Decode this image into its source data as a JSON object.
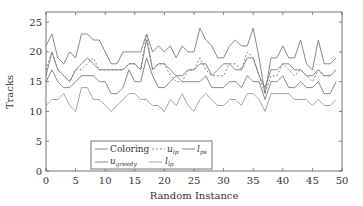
{
  "chart_data": {
    "type": "line",
    "title": "",
    "xlabel": "Random Instance",
    "ylabel": "Tracks",
    "xlim": [
      0,
      50
    ],
    "ylim": [
      0,
      26.7
    ],
    "xticks": [
      0,
      5,
      10,
      15,
      20,
      25,
      30,
      35,
      40,
      45,
      50
    ],
    "yticks": [
      0,
      5,
      10,
      15,
      20,
      25
    ],
    "grid": false,
    "legend_position": "lower left inside",
    "x": [
      0,
      1,
      2,
      3,
      4,
      5,
      6,
      7,
      8,
      9,
      10,
      11,
      12,
      13,
      14,
      15,
      16,
      17,
      18,
      19,
      20,
      21,
      22,
      23,
      24,
      25,
      26,
      27,
      28,
      29,
      30,
      31,
      32,
      33,
      34,
      35,
      36,
      37,
      38,
      39,
      40,
      41,
      42,
      43,
      44,
      45,
      46,
      47,
      48,
      49
    ],
    "series": [
      {
        "name": "Coloring",
        "style": "solid",
        "values": [
          21,
          23,
          19,
          18,
          20,
          19,
          23,
          23,
          22,
          22,
          20,
          18,
          18,
          20,
          20,
          20,
          20,
          23,
          20,
          21,
          20,
          21,
          19,
          21,
          20,
          20,
          24,
          22,
          21,
          19,
          19,
          21,
          22,
          21,
          21,
          24,
          19,
          13,
          19,
          19,
          21,
          19,
          19,
          22,
          18,
          17,
          22,
          18,
          18,
          19
        ]
      },
      {
        "name": "u_lp",
        "style": "dashed",
        "values": [
          17,
          20,
          17,
          16,
          15,
          17,
          17,
          18,
          19,
          17,
          17,
          17,
          17,
          17,
          18,
          18,
          17,
          23,
          17,
          18,
          18,
          16,
          15,
          15,
          17,
          17,
          19,
          17,
          16,
          16,
          16,
          18,
          18,
          17,
          20,
          19,
          16,
          13,
          16,
          16,
          18,
          17,
          16,
          17,
          16,
          15,
          17,
          16,
          16,
          17
        ]
      },
      {
        "name": "l_ps",
        "style": "solid",
        "values": [
          16,
          20,
          17,
          16,
          15,
          17,
          18,
          19,
          18,
          17,
          17,
          17,
          17,
          17,
          18,
          18,
          17,
          22,
          17,
          18,
          18,
          17,
          16,
          16,
          17,
          17,
          18,
          18,
          16,
          17,
          18,
          18,
          17,
          17,
          19,
          19,
          16,
          14,
          17,
          17,
          18,
          18,
          17,
          17,
          16,
          16,
          17,
          16,
          16,
          17
        ]
      },
      {
        "name": "u_greedy",
        "style": "solid",
        "values": [
          15,
          17,
          15,
          14,
          14,
          15,
          16,
          16,
          16,
          15,
          15,
          13,
          13,
          14,
          17,
          15,
          15,
          19,
          16,
          14,
          14,
          15,
          16,
          15,
          15,
          15,
          15,
          16,
          14,
          14,
          14,
          15,
          15,
          14,
          16,
          15,
          15,
          12,
          15,
          15,
          16,
          14,
          14,
          15,
          14,
          14,
          15,
          13,
          13,
          15
        ]
      },
      {
        "name": "l_lp",
        "style": "solid",
        "values": [
          11,
          12,
          12,
          13,
          11,
          10,
          14,
          14,
          12,
          12,
          11,
          10,
          11,
          12,
          13,
          13,
          12,
          12,
          11,
          11,
          10,
          12,
          11,
          13,
          11,
          10,
          12,
          13,
          12,
          11,
          11,
          12,
          12,
          11,
          13,
          13,
          12,
          10,
          13,
          13,
          13,
          13,
          12,
          12,
          12,
          11,
          12,
          11,
          11,
          12
        ]
      }
    ],
    "legend": [
      "Coloring",
      "u_lp",
      "l_ps",
      "u_greedy",
      "l_lp"
    ]
  },
  "labels": {
    "xlabel": "Random Instance",
    "ylabel": "Tracks",
    "legend": {
      "coloring": "Coloring",
      "u_lp_base": "u",
      "u_lp_sub": "lp",
      "l_ps_base": "l",
      "l_ps_sub": "ps",
      "u_greedy_base": "u",
      "u_greedy_sub": "greedy",
      "l_lp_base": "l",
      "l_lp_sub": "lp"
    }
  },
  "colors": {
    "line": "#7a7a7a",
    "axis": "#555555",
    "text": "#333333",
    "background": "#ffffff"
  }
}
